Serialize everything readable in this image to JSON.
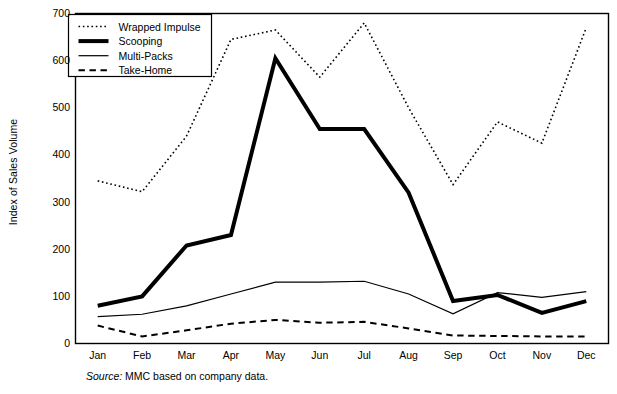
{
  "chart_data": {
    "type": "line",
    "title": "",
    "xlabel": "",
    "ylabel": "Index of Sales Volume",
    "categories": [
      "Jan",
      "Feb",
      "Mar",
      "Apr",
      "May",
      "Jun",
      "Jul",
      "Aug",
      "Sep",
      "Oct",
      "Nov",
      "Dec"
    ],
    "ylim": [
      0,
      700
    ],
    "yticks": [
      0,
      100,
      200,
      300,
      400,
      500,
      600,
      700
    ],
    "grid": false,
    "legend_position": "top-left",
    "series": [
      {
        "name": "Wrapped Impulse",
        "style": "dotted",
        "width": 1.6,
        "color": "#000000",
        "values": [
          345,
          322,
          440,
          645,
          665,
          565,
          680,
          500,
          337,
          470,
          425,
          670
        ]
      },
      {
        "name": "Scooping",
        "style": "solid",
        "width": 4.0,
        "color": "#000000",
        "values": [
          80,
          100,
          208,
          230,
          605,
          455,
          455,
          320,
          90,
          103,
          65,
          90
        ]
      },
      {
        "name": "Multi-Packs",
        "style": "solid",
        "width": 1.2,
        "color": "#000000",
        "values": [
          57,
          62,
          80,
          105,
          130,
          130,
          132,
          105,
          63,
          108,
          98,
          110
        ]
      },
      {
        "name": "Take-Home",
        "style": "dashed",
        "width": 2.0,
        "color": "#000000",
        "values": [
          38,
          15,
          28,
          42,
          50,
          44,
          46,
          32,
          17,
          16,
          15,
          15
        ]
      }
    ]
  },
  "source": {
    "label": "Source:",
    "text": "MMC based on company data."
  },
  "axis": {
    "frame_color": "#000000"
  }
}
